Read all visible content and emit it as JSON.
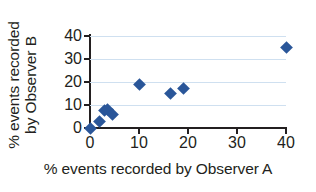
{
  "chart_data": {
    "type": "scatter",
    "title": "",
    "xlabel": "% events recorded by Observer A",
    "ylabel_line1": "% events recorded",
    "ylabel_line2": "by Observer B",
    "xlim": [
      0,
      40
    ],
    "ylim": [
      0,
      40
    ],
    "xticks": [
      "0",
      "10",
      "20",
      "30",
      "40"
    ],
    "yticks": [
      "0",
      "10",
      "20",
      "30",
      "40"
    ],
    "xtick_values": [
      0,
      10,
      20,
      30,
      40
    ],
    "ytick_values": [
      0,
      10,
      20,
      30,
      40
    ],
    "grid": "horizontal",
    "grid_color": "#cfe0f0",
    "legend": "none",
    "marker_shape": "diamond",
    "marker_color": "#2a5699",
    "series": [
      {
        "name": "observations",
        "points": [
          {
            "x": 0,
            "y": 0
          },
          {
            "x": 2,
            "y": 3
          },
          {
            "x": 3,
            "y": 7.5
          },
          {
            "x": 3.6,
            "y": 8
          },
          {
            "x": 4.6,
            "y": 6
          },
          {
            "x": 10,
            "y": 19
          },
          {
            "x": 16.5,
            "y": 15
          },
          {
            "x": 19,
            "y": 17
          },
          {
            "x": 40,
            "y": 35
          }
        ]
      }
    ]
  }
}
